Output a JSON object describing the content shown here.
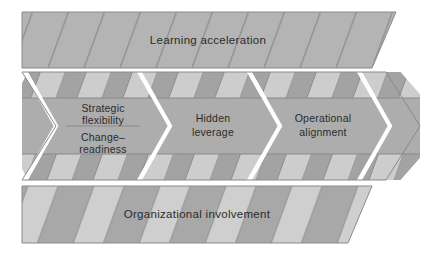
{
  "diagram": {
    "type": "chevron-process-layers",
    "background_color": "#ffffff",
    "bands": {
      "top": {
        "name": "learning-acceleration-band",
        "label": "Learning acceleration",
        "fill_color": "#b4b4b4",
        "stripe_style": "thin-diagonal-lines",
        "stripe_color": "#8f8f8f"
      },
      "middle": {
        "name": "chevron-arrow-band",
        "fill_color": "#b0b0b0",
        "stripe_light": "#cdcdcd",
        "stripe_dark": "#a3a3a3",
        "separator_color": "#ffffff",
        "center_plate_color": "#adadad",
        "divider_color": "#8a8a8a",
        "arrows": [
          {
            "name": "arrow-strategic-flexibility",
            "labels": [
              "Strategic",
              "flexibility",
              "Change–",
              "readiness"
            ],
            "label_top": "Strategic flexibility",
            "label_bottom": "Change–readiness",
            "has_divider": true
          },
          {
            "name": "arrow-hidden-leverage",
            "labels": [
              "Hidden",
              "leverage"
            ],
            "label_top": "Hidden leverage",
            "label_bottom": "",
            "has_divider": false
          },
          {
            "name": "arrow-operational-alignment",
            "labels": [
              "Operational",
              "alignment"
            ],
            "label_top": "Operational alignment",
            "label_bottom": "",
            "has_divider": false
          },
          {
            "name": "arrow-tip-blank",
            "labels": [],
            "label_top": "",
            "label_bottom": "",
            "has_divider": false
          }
        ]
      },
      "bottom": {
        "name": "organizational-involvement-band",
        "label": "Organizational involvement",
        "fill_color": "#b4b4b4",
        "stripe_light": "#cfcfcf",
        "stripe_dark": "#a8a8a8",
        "stripe_style": "wide-diagonal-stripes"
      }
    }
  }
}
